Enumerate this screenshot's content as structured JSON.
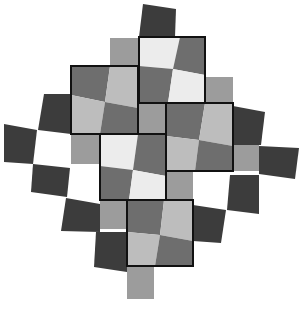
{
  "figure": {
    "title": "Checkerboard tile illusion",
    "width": 304,
    "height": 309,
    "background": "#ffffff"
  },
  "palette": {
    "dark": "#3c3c3c",
    "mid_dark": "#6e6e6e",
    "mid": "#9c9c9c",
    "light": "#bdbdbd",
    "very_light": "#ececec",
    "outline": "#111111"
  },
  "tiles": [
    {
      "name": "top-dark-tile",
      "fill": "dark",
      "points": "143,4 176,9 175,37 139,37"
    },
    {
      "name": "top-left-gray-square",
      "fill": "mid",
      "points": "110,38 139,38 139,66 110,66"
    },
    {
      "name": "right-upper-gray-square",
      "fill": "mid",
      "points": "205,77 233,77 233,103 205,103"
    },
    {
      "name": "square-a-q1",
      "fill": "very_light",
      "points": "139,37 180,37 173,69 139,66"
    },
    {
      "name": "square-a-q2",
      "fill": "mid_dark",
      "points": "180,37 205,37 205,75 173,69"
    },
    {
      "name": "square-a-q3",
      "fill": "mid_dark",
      "points": "139,66 173,69 168,103 139,103"
    },
    {
      "name": "square-a-q4",
      "fill": "very_light",
      "points": "173,69 205,75 205,103 168,103"
    },
    {
      "name": "square-b-q1",
      "fill": "mid_dark",
      "points": "71,66 110,66 105,102 71,95"
    },
    {
      "name": "square-b-q2",
      "fill": "light",
      "points": "110,66 138,66 138,108 105,102"
    },
    {
      "name": "square-b-q3",
      "fill": "light",
      "points": "71,95 105,102 100,134 71,134"
    },
    {
      "name": "square-b-q4",
      "fill": "mid_dark",
      "points": "105,102 138,108 138,134 100,134"
    },
    {
      "name": "center-small-gray-square",
      "fill": "mid",
      "points": "138,103 166,103 166,134 138,134"
    },
    {
      "name": "left-mid-gray-square",
      "fill": "mid",
      "points": "71,134 100,134 100,164 71,164"
    },
    {
      "name": "square-d-q1",
      "fill": "mid_dark",
      "points": "166,103 205,103 199,140 166,136"
    },
    {
      "name": "square-d-q2",
      "fill": "light",
      "points": "205,103 233,103 233,146 199,140"
    },
    {
      "name": "square-d-q3",
      "fill": "light",
      "points": "166,136 199,140 195,171 166,171"
    },
    {
      "name": "square-d-q4",
      "fill": "mid_dark",
      "points": "199,140 233,146 233,171 195,171"
    },
    {
      "name": "square-c-q1",
      "fill": "very_light",
      "points": "100,134 138,134 133,170 100,166"
    },
    {
      "name": "square-c-q2",
      "fill": "mid_dark",
      "points": "138,134 166,134 166,176 133,170"
    },
    {
      "name": "square-c-q3",
      "fill": "mid_dark",
      "points": "100,166 133,170 129,200 100,200"
    },
    {
      "name": "square-c-q4",
      "fill": "very_light",
      "points": "133,170 166,176 166,200 129,200"
    },
    {
      "name": "lower-mid-gray-square",
      "fill": "mid",
      "points": "166,171 193,171 193,200 166,200"
    },
    {
      "name": "right-mid-gray-square",
      "fill": "mid",
      "points": "233,145 259,145 259,171 233,171"
    },
    {
      "name": "lower-left-gray-square",
      "fill": "mid",
      "points": "100,200 127,200 127,229 100,229"
    },
    {
      "name": "square-e-q1",
      "fill": "mid_dark",
      "points": "127,200 164,200 160,235 127,232"
    },
    {
      "name": "square-e-q2",
      "fill": "light",
      "points": "164,200 193,200 193,241 160,235"
    },
    {
      "name": "square-e-q3",
      "fill": "light",
      "points": "127,232 160,235 155,266 127,266"
    },
    {
      "name": "square-e-q4",
      "fill": "mid_dark",
      "points": "160,235 193,241 193,266 155,266"
    },
    {
      "name": "bottom-gray-square",
      "fill": "mid",
      "points": "127,266 154,266 154,299 127,299"
    },
    {
      "name": "left-dark-tile-1",
      "fill": "dark",
      "points": "44,94 71,94 71,134 38,130"
    },
    {
      "name": "left-dark-tile-2",
      "fill": "dark",
      "points": "4,124 37,130 33,164 4,162"
    },
    {
      "name": "left-dark-tile-3",
      "fill": "dark",
      "points": "33,164 70,168 67,197 31,192"
    },
    {
      "name": "left-dark-tile-4",
      "fill": "dark",
      "points": "66,198 100,204 100,232 61,231"
    },
    {
      "name": "left-dark-tile-5",
      "fill": "dark",
      "points": "96,232 127,232 127,272 94,267"
    },
    {
      "name": "right-dark-tile-1",
      "fill": "dark",
      "points": "233,106 265,112 261,145 233,145"
    },
    {
      "name": "right-dark-tile-2",
      "fill": "dark",
      "points": "259,146 299,148 295,179 259,174"
    },
    {
      "name": "right-dark-tile-3",
      "fill": "dark",
      "points": "230,175 259,175 259,214 227,210"
    },
    {
      "name": "right-dark-tile-4",
      "fill": "dark",
      "points": "193,205 226,210 221,243 193,241"
    }
  ],
  "outlined_squares": [
    {
      "name": "square-a-outline",
      "x": 139,
      "y": 37,
      "w": 66,
      "h": 66
    },
    {
      "name": "square-b-outline",
      "x": 71,
      "y": 66,
      "w": 67,
      "h": 68
    },
    {
      "name": "square-c-outline",
      "x": 100,
      "y": 134,
      "w": 66,
      "h": 66
    },
    {
      "name": "square-d-outline",
      "x": 166,
      "y": 103,
      "w": 67,
      "h": 68
    },
    {
      "name": "square-e-outline",
      "x": 127,
      "y": 200,
      "w": 66,
      "h": 66
    },
    {
      "name": "center-small-outline",
      "x": 138,
      "y": 103,
      "w": 28,
      "h": 31
    }
  ]
}
